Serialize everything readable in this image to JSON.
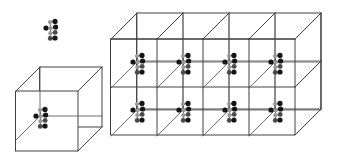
{
  "figure": {
    "background_color": "#ffffff",
    "width": 354,
    "height": 165,
    "edge_color": "#2b2b2b",
    "inner_edge_color": "#555555",
    "bond_color": "#3a3a3a"
  },
  "atom_styles": {
    "dark": {
      "color": "#151515",
      "radius": 2.6,
      "label": "dark-atom"
    },
    "mid": {
      "color": "#4a4a4a",
      "radius": 2.4,
      "label": "mid-atom"
    },
    "light": {
      "color": "#9a9a9a",
      "radius": 2.1,
      "label": "light-atom"
    }
  },
  "cluster_template": {
    "description": "Molecular cluster motif repeated at each lattice node",
    "atoms": [
      {
        "dx": 0.0,
        "dy": 0.0,
        "type": "dark"
      },
      {
        "dx": 4.6,
        "dy": 0.3,
        "type": "light"
      },
      {
        "dx": 4.0,
        "dy": -6.0,
        "type": "light"
      },
      {
        "dx": 9.0,
        "dy": -6.6,
        "type": "dark"
      },
      {
        "dx": 9.6,
        "dy": -1.0,
        "type": "dark"
      },
      {
        "dx": 4.4,
        "dy": 5.2,
        "type": "light"
      },
      {
        "dx": 9.2,
        "dy": 4.4,
        "type": "mid"
      },
      {
        "dx": 4.2,
        "dy": 10.4,
        "type": "mid"
      },
      {
        "dx": 9.0,
        "dy": 10.0,
        "type": "dark"
      }
    ],
    "bonds": [
      {
        "from": 0,
        "to": 1
      },
      {
        "from": 1,
        "to": 4
      },
      {
        "from": 2,
        "to": 3
      },
      {
        "from": 1,
        "to": 2
      },
      {
        "from": 1,
        "to": 5
      },
      {
        "from": 5,
        "to": 6
      },
      {
        "from": 5,
        "to": 7
      },
      {
        "from": 7,
        "to": 8
      }
    ]
  },
  "floating_cluster": {
    "name": "detached-molecular-cluster",
    "anchor": {
      "x": 46,
      "y": 28
    },
    "caption": ""
  },
  "single_cell": {
    "name": "single-unit-cell",
    "origin": {
      "x": 16,
      "y": 91
    },
    "width": 62,
    "height": 60,
    "depth_x": 24,
    "depth_y": -24,
    "cluster_anchor": {
      "x": 36,
      "y": 116
    },
    "caption": ""
  },
  "lattice_block": {
    "name": "lattice-array-block",
    "origin": {
      "x": 111,
      "y": 39
    },
    "columns": 4,
    "rows": 2,
    "cell_width": 46,
    "cell_height": 48,
    "depth_x": 26,
    "depth_y": -26,
    "cell_count": 8,
    "caption": ""
  },
  "legend": {
    "visible": false,
    "entries": []
  }
}
